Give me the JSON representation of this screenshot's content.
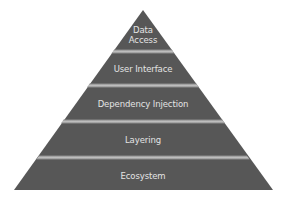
{
  "diagram": {
    "type": "pyramid",
    "colors": {
      "fill": "#575757",
      "band": "#b0b0b0",
      "text": "#e4e4e4",
      "background": "#ffffff"
    },
    "levels": [
      {
        "label_line1": "Data",
        "label_line2": "Access"
      },
      {
        "label": "User Interface"
      },
      {
        "label": "Dependency Injection"
      },
      {
        "label": "Layering"
      },
      {
        "label": "Ecosystem"
      }
    ]
  }
}
